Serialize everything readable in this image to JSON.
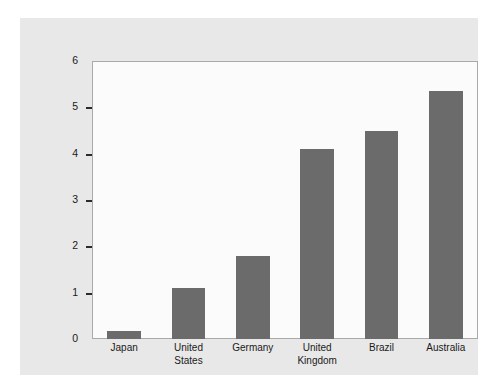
{
  "chart_data": {
    "type": "bar",
    "title": "",
    "xlabel": "",
    "ylabel": "Annualized Interest Rate (%)",
    "categories": [
      "Japan",
      "United States",
      "Germany",
      "United Kingdom",
      "Brazil",
      "Australia"
    ],
    "category_lines": [
      [
        "Japan"
      ],
      [
        "United",
        "States"
      ],
      [
        "Germany"
      ],
      [
        "United",
        "Kingdom"
      ],
      [
        "Brazil"
      ],
      [
        "Australia"
      ]
    ],
    "values": [
      0.18,
      1.1,
      1.8,
      4.1,
      4.5,
      5.35
    ],
    "ylim": [
      0,
      6
    ],
    "ytick_labels": [
      "0",
      "1",
      "2",
      "3",
      "4",
      "5",
      "6"
    ],
    "ytick_values": [
      0,
      1,
      2,
      3,
      4,
      5,
      6
    ],
    "grid": false,
    "legend": "none",
    "bar_color": "#6b6b6b",
    "panel_color": "#e8e8e8",
    "plot_background": "#fbfbfb",
    "axis_color": "#a9a9a9",
    "text_color": "#1a1a1a"
  }
}
